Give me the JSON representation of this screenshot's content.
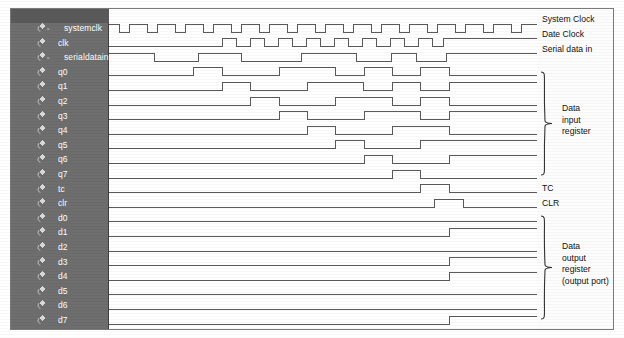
{
  "diagram": {
    "background_color": "#ffffff",
    "panel_color": "#6e6e6e",
    "panel_text_color": "#ffffff",
    "wave_color": "#5a5a5a",
    "frame_color": "#7a7a7a"
  },
  "signal_panel": {
    "icon_name": "waveform-signal-icon",
    "rows": [
      {
        "name": "systemclk",
        "badge": "a",
        "indent": true
      },
      {
        "name": "clk",
        "badge": "",
        "indent": false
      },
      {
        "name": "serialdatain",
        "badge": "a",
        "indent": true
      },
      {
        "name": "q0",
        "badge": "",
        "indent": false
      },
      {
        "name": "q1",
        "badge": "",
        "indent": false
      },
      {
        "name": "q2",
        "badge": "",
        "indent": false
      },
      {
        "name": "q3",
        "badge": "",
        "indent": false
      },
      {
        "name": "q4",
        "badge": "",
        "indent": false
      },
      {
        "name": "q5",
        "badge": "",
        "indent": false
      },
      {
        "name": "q6",
        "badge": "",
        "indent": false
      },
      {
        "name": "q7",
        "badge": "",
        "indent": false
      },
      {
        "name": "tc",
        "badge": "",
        "indent": false
      },
      {
        "name": "clr",
        "badge": "",
        "indent": false
      },
      {
        "name": "d0",
        "badge": "",
        "indent": false
      },
      {
        "name": "d1",
        "badge": "",
        "indent": false
      },
      {
        "name": "d2",
        "badge": "",
        "indent": false
      },
      {
        "name": "d3",
        "badge": "",
        "indent": false
      },
      {
        "name": "d4",
        "badge": "",
        "indent": false
      },
      {
        "name": "d5",
        "badge": "",
        "indent": false
      },
      {
        "name": "d6",
        "badge": "",
        "indent": false
      },
      {
        "name": "d7",
        "badge": "",
        "indent": false
      }
    ]
  },
  "annotations": {
    "system_clock": "System Clock",
    "date_clock": "Date Clock",
    "serial_data_in": "Serial data in",
    "tc": "TC",
    "clr": "CLR",
    "data_input_register": [
      "Data",
      "input",
      "register"
    ],
    "data_output_register": [
      "Data",
      "output",
      "register",
      "(output port)"
    ]
  },
  "chart_data": {
    "type": "line",
    "xlabel": "time",
    "ylabel": "logic level",
    "x_range": [
      0,
      428
    ],
    "row_height": 14.6,
    "row_top": 12,
    "high_offset": 3,
    "low_offset": 11,
    "note": "Each waveform is a digital 0/1 trace. 'transitions' lists x pixel positions (within the 428px wide wave area) where the level toggles; 'start' is the level at x=0.",
    "series": [
      {
        "name": "systemclk",
        "start": 1,
        "transitions": [
          10,
          20,
          38,
          48,
          66,
          76,
          94,
          104,
          122,
          132,
          150,
          160,
          178,
          188,
          206,
          216,
          234,
          244,
          262,
          272,
          290,
          300,
          318,
          328,
          346,
          356,
          374,
          384,
          402,
          412,
          428
        ]
      },
      {
        "name": "clk",
        "start": 0,
        "transitions": [
          113,
          127,
          141,
          155,
          169,
          183,
          197,
          211,
          225,
          239,
          253,
          267,
          281,
          295,
          309,
          323,
          334
        ]
      },
      {
        "name": "serialdatain",
        "start": 1,
        "transitions": [
          45,
          89,
          132,
          192,
          247,
          282,
          307,
          337
        ]
      },
      {
        "name": "q0",
        "start": 0,
        "transitions": [
          84,
          113,
          170,
          226,
          255,
          283,
          311,
          340
        ]
      },
      {
        "name": "q1",
        "start": 0,
        "transitions": [
          113,
          141,
          198,
          254,
          283,
          311,
          340
        ]
      },
      {
        "name": "q2",
        "start": 0,
        "transitions": [
          141,
          170,
          226,
          283,
          311,
          340
        ]
      },
      {
        "name": "q3",
        "start": 0,
        "transitions": [
          170,
          198,
          255,
          311,
          340
        ]
      },
      {
        "name": "q4",
        "start": 0,
        "transitions": [
          198,
          226,
          283,
          340
        ]
      },
      {
        "name": "q5",
        "start": 0,
        "transitions": [
          226,
          255,
          311
        ]
      },
      {
        "name": "q6",
        "start": 0,
        "transitions": [
          255,
          283,
          340
        ]
      },
      {
        "name": "q7",
        "start": 0,
        "transitions": [
          283,
          311
        ]
      },
      {
        "name": "tc",
        "start": 0,
        "transitions": [
          311,
          340
        ]
      },
      {
        "name": "clr",
        "start": 0,
        "transitions": [
          325,
          354
        ]
      },
      {
        "name": "d0",
        "start": 0,
        "transitions": []
      },
      {
        "name": "d1",
        "start": 0,
        "transitions": [
          340
        ]
      },
      {
        "name": "d2",
        "start": 0,
        "transitions": []
      },
      {
        "name": "d3",
        "start": 0,
        "transitions": [
          340
        ]
      },
      {
        "name": "d4",
        "start": 0,
        "transitions": [
          340
        ]
      },
      {
        "name": "d5",
        "start": 0,
        "transitions": []
      },
      {
        "name": "d6",
        "start": 0,
        "transitions": []
      },
      {
        "name": "d7",
        "start": 0,
        "transitions": [
          340
        ]
      }
    ]
  }
}
